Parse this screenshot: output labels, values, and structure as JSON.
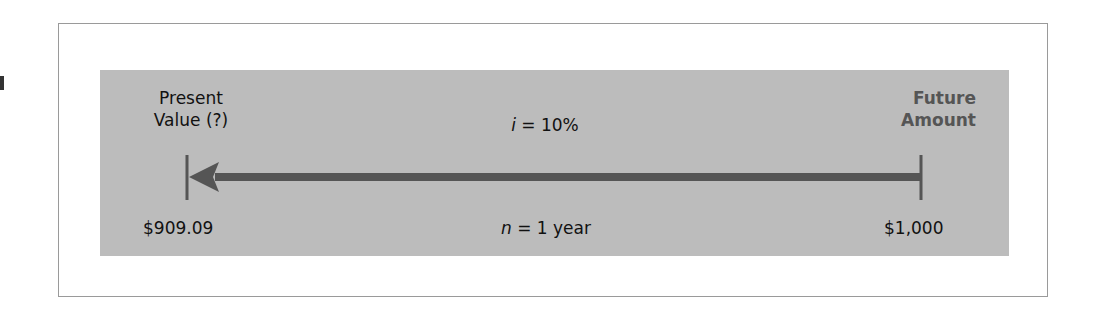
{
  "diagram": {
    "type": "timeline",
    "left_endpoint": {
      "title_line1": "Present",
      "title_line2": "Value (?)",
      "value": "$909.09"
    },
    "right_endpoint": {
      "title_line1": "Future",
      "title_line2": "Amount",
      "value": "$1,000"
    },
    "rate": {
      "symbol": "i",
      "text": " = 10%"
    },
    "period": {
      "symbol": "n",
      "text": " = 1 year"
    },
    "arrow_direction": "right-to-left",
    "colors": {
      "panel": "#bcbcbc",
      "frame_border": "#9a9a9a",
      "arrow": "#555555",
      "future_amount_text": "#555555",
      "text": "#111111"
    }
  }
}
